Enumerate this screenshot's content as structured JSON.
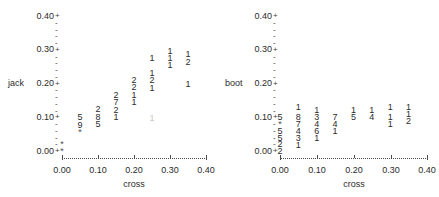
{
  "chart_data": [
    {
      "type": "scatter",
      "panel": "left",
      "title": "",
      "ylabel": "jack",
      "xlabel": "cross",
      "xlim": [
        0.0,
        0.4
      ],
      "ylim": [
        0.0,
        0.4
      ],
      "xticks": [
        "0.00",
        "0.10",
        "0.20",
        "0.30",
        "0.40"
      ],
      "xtick_values": [
        0.0,
        0.1,
        0.2,
        0.3,
        0.4
      ],
      "yticks": [
        "0.00",
        "0.10",
        "0.20",
        "0.30",
        "0.40"
      ],
      "ytick_values": [
        0.0,
        0.1,
        0.2,
        0.3,
        0.4
      ],
      "grid": false,
      "legend": "none",
      "note": "Stacked-digit scatter: each glyph is a count label plotted at (x,y)",
      "points": [
        {
          "x": 0.0,
          "y": 0.02,
          "label": "*"
        },
        {
          "x": 0.0,
          "y": 0.0,
          "label": "*"
        },
        {
          "x": 0.05,
          "y": 0.1,
          "label": "5"
        },
        {
          "x": 0.05,
          "y": 0.077,
          "label": "9"
        },
        {
          "x": 0.05,
          "y": 0.055,
          "label": "*"
        },
        {
          "x": 0.1,
          "y": 0.122,
          "label": "2"
        },
        {
          "x": 0.1,
          "y": 0.1,
          "label": "8"
        },
        {
          "x": 0.1,
          "y": 0.078,
          "label": "5"
        },
        {
          "x": 0.15,
          "y": 0.165,
          "label": "2"
        },
        {
          "x": 0.15,
          "y": 0.143,
          "label": "7"
        },
        {
          "x": 0.15,
          "y": 0.121,
          "label": "2"
        },
        {
          "x": 0.15,
          "y": 0.099,
          "label": "1"
        },
        {
          "x": 0.2,
          "y": 0.209,
          "label": "2"
        },
        {
          "x": 0.2,
          "y": 0.187,
          "label": "2"
        },
        {
          "x": 0.2,
          "y": 0.165,
          "label": "1"
        },
        {
          "x": 0.2,
          "y": 0.143,
          "label": "1"
        },
        {
          "x": 0.25,
          "y": 0.274,
          "label": "1"
        },
        {
          "x": 0.25,
          "y": 0.23,
          "label": "1"
        },
        {
          "x": 0.25,
          "y": 0.208,
          "label": "2"
        },
        {
          "x": 0.25,
          "y": 0.186,
          "label": "1"
        },
        {
          "x": 0.25,
          "y": 0.095,
          "label": "1",
          "faint": true
        },
        {
          "x": 0.3,
          "y": 0.296,
          "label": "1"
        },
        {
          "x": 0.3,
          "y": 0.274,
          "label": "1"
        },
        {
          "x": 0.3,
          "y": 0.252,
          "label": "1"
        },
        {
          "x": 0.35,
          "y": 0.285,
          "label": "1"
        },
        {
          "x": 0.35,
          "y": 0.263,
          "label": "2"
        },
        {
          "x": 0.35,
          "y": 0.196,
          "label": "1"
        }
      ]
    },
    {
      "type": "scatter",
      "panel": "right",
      "title": "",
      "ylabel": "boot",
      "xlabel": "cross",
      "xlim": [
        0.0,
        0.4
      ],
      "ylim": [
        0.0,
        0.4
      ],
      "xticks": [
        "0.00",
        "0.10",
        "0.20",
        "0.30",
        "0.40"
      ],
      "xtick_values": [
        0.0,
        0.1,
        0.2,
        0.3,
        0.4
      ],
      "yticks": [
        "0.00",
        "0.10",
        "0.20",
        "0.30",
        "0.40"
      ],
      "ytick_values": [
        0.0,
        0.1,
        0.2,
        0.3,
        0.4
      ],
      "grid": false,
      "legend": "none",
      "note": "Stacked-digit scatter: each glyph is a count label plotted at (x,y)",
      "points": [
        {
          "x": 0.0,
          "y": 0.1,
          "label": "5"
        },
        {
          "x": 0.0,
          "y": 0.08,
          "label": "*"
        },
        {
          "x": 0.0,
          "y": 0.058,
          "label": "5"
        },
        {
          "x": 0.0,
          "y": 0.038,
          "label": "5"
        },
        {
          "x": 0.0,
          "y": 0.018,
          "label": "2"
        },
        {
          "x": 0.0,
          "y": 0.0,
          "label": "2"
        },
        {
          "x": 0.05,
          "y": 0.13,
          "label": "1"
        },
        {
          "x": 0.05,
          "y": 0.1,
          "label": "8"
        },
        {
          "x": 0.05,
          "y": 0.08,
          "label": "7"
        },
        {
          "x": 0.05,
          "y": 0.059,
          "label": "4"
        },
        {
          "x": 0.05,
          "y": 0.038,
          "label": "3"
        },
        {
          "x": 0.05,
          "y": 0.017,
          "label": "1"
        },
        {
          "x": 0.1,
          "y": 0.12,
          "label": "1"
        },
        {
          "x": 0.1,
          "y": 0.1,
          "label": "3"
        },
        {
          "x": 0.1,
          "y": 0.079,
          "label": "4"
        },
        {
          "x": 0.1,
          "y": 0.058,
          "label": "6"
        },
        {
          "x": 0.1,
          "y": 0.037,
          "label": "1"
        },
        {
          "x": 0.15,
          "y": 0.1,
          "label": "7"
        },
        {
          "x": 0.15,
          "y": 0.079,
          "label": "4"
        },
        {
          "x": 0.15,
          "y": 0.058,
          "label": "1"
        },
        {
          "x": 0.2,
          "y": 0.12,
          "label": "1"
        },
        {
          "x": 0.2,
          "y": 0.1,
          "label": "5"
        },
        {
          "x": 0.25,
          "y": 0.12,
          "label": "1"
        },
        {
          "x": 0.25,
          "y": 0.1,
          "label": "4"
        },
        {
          "x": 0.3,
          "y": 0.13,
          "label": "1"
        },
        {
          "x": 0.3,
          "y": 0.1,
          "label": "1"
        },
        {
          "x": 0.3,
          "y": 0.079,
          "label": "1"
        },
        {
          "x": 0.35,
          "y": 0.13,
          "label": "1"
        },
        {
          "x": 0.35,
          "y": 0.108,
          "label": "1"
        },
        {
          "x": 0.35,
          "y": 0.086,
          "label": "2"
        }
      ]
    }
  ],
  "panels": [
    {
      "id": "left",
      "ylabel": "jack",
      "xlabel": "cross",
      "yticks": [
        "0.40",
        "0.30",
        "0.20",
        "0.10",
        "0.00"
      ],
      "xticks": [
        "0.00",
        "0.10",
        "0.20",
        "0.30",
        "0.40"
      ]
    },
    {
      "id": "right",
      "ylabel": "boot",
      "xlabel": "cross",
      "yticks": [
        "0.40",
        "0.30",
        "0.20",
        "0.10",
        "0.00"
      ],
      "xticks": [
        "0.00",
        "0.10",
        "0.20",
        "0.30",
        "0.40"
      ]
    }
  ]
}
